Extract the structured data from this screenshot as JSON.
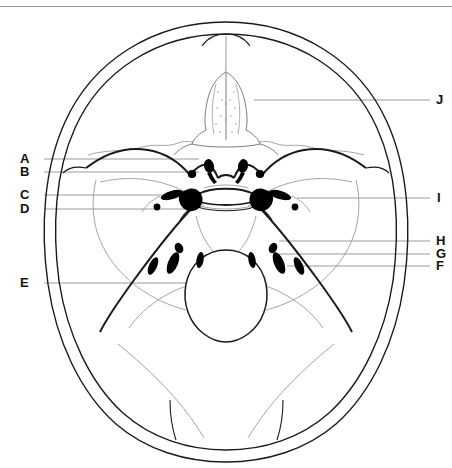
{
  "figure": {
    "kind": "anatomical-line-diagram",
    "view": "superior view of the internal cranial base (skull base) with labelled leader lines",
    "background_color": "#ffffff",
    "ink_color": "#000000",
    "faint_ink_color": "#8c8c8c",
    "leader_color": "#9a9a9a",
    "border": {
      "top_rule_color": "#9a9a9a",
      "top_rule_y": 6
    }
  },
  "labels": {
    "left": [
      {
        "id": "A",
        "text": "A",
        "x": 20,
        "y": 152,
        "leader_from_x": 44,
        "leader_to_x": 199,
        "leader_y": 159
      },
      {
        "id": "B",
        "text": "B",
        "x": 20,
        "y": 165,
        "leader_from_x": 44,
        "leader_to_x": 199,
        "leader_y": 172
      },
      {
        "id": "C",
        "text": "C",
        "x": 20,
        "y": 188,
        "leader_from_x": 44,
        "leader_to_x": 196,
        "leader_y": 195
      },
      {
        "id": "D",
        "text": "D",
        "x": 20,
        "y": 202,
        "leader_from_x": 44,
        "leader_to_x": 196,
        "leader_y": 209
      },
      {
        "id": "E",
        "text": "E",
        "x": 20,
        "y": 276,
        "leader_from_x": 44,
        "leader_to_x": 232,
        "leader_y": 283
      }
    ],
    "right": [
      {
        "id": "J",
        "text": "J",
        "x": 436,
        "y": 93,
        "leader_from_x": 254,
        "leader_to_x": 430,
        "leader_y": 100
      },
      {
        "id": "I",
        "text": "I",
        "x": 436,
        "y": 191,
        "leader_from_x": 297,
        "leader_to_x": 430,
        "leader_y": 198
      },
      {
        "id": "H",
        "text": "H",
        "x": 436,
        "y": 234,
        "leader_from_x": 279,
        "leader_to_x": 430,
        "leader_y": 241
      },
      {
        "id": "G",
        "text": "G",
        "x": 436,
        "y": 247,
        "leader_from_x": 279,
        "leader_to_x": 430,
        "leader_y": 254
      },
      {
        "id": "F",
        "text": "F",
        "x": 436,
        "y": 259,
        "leader_from_x": 287,
        "leader_to_x": 430,
        "leader_y": 266
      }
    ]
  },
  "structures": {
    "cranial_vault_outer": "double-contour oval outline of the calvarium",
    "cranial_vault_inner": "inner table contour",
    "crista_galli_ethmoid": "midline anterior stippled structure indicated by J",
    "lesser_wing_sphenoid": "paired curved ridges of the anterior cranial fossa",
    "sella_turcica": "central saddle region with paired dark foramina",
    "petrous_ridges": "paired oblique ridges separating middle and posterior fossae",
    "foramen_magnum": "large central posterior oval opening indicated by E",
    "foramina_count": 18
  }
}
